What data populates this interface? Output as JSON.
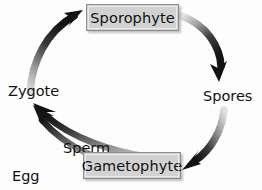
{
  "diagram": {
    "type": "cycle-diagram",
    "background_color": "#fdfdfd",
    "text_color": "#111111",
    "box_fill_color": "#d2d2d2",
    "box_border_color": "#8e8e8e",
    "arrow_dark_color": "#1a1a1a",
    "arrow_light_color": "#cfcfcf",
    "stages": [
      {
        "id": "sporophyte",
        "label": "Sporophyte",
        "boxed": true
      },
      {
        "id": "gametophyte",
        "label": "Gametophyte",
        "boxed": true
      }
    ],
    "nodes": [
      {
        "id": "zygote",
        "label": "Zygote",
        "boxed": false
      },
      {
        "id": "spores",
        "label": "Spores",
        "boxed": false
      }
    ],
    "connectors": [
      {
        "id": "zygote-to-sporophyte",
        "from": "Zygote",
        "to": "Sporophyte",
        "label": "",
        "direction": "up-right",
        "shading": "light-to-dark"
      },
      {
        "id": "sporophyte-to-spores",
        "from": "Sporophyte",
        "to": "Spores",
        "label": "",
        "direction": "down-right",
        "shading": "light-to-dark"
      },
      {
        "id": "spores-to-gametophyte",
        "from": "Spores",
        "to": "Gametophyte",
        "label": "",
        "direction": "down-left",
        "shading": "light-to-dark"
      },
      {
        "id": "gametophyte-to-zygote-sperm",
        "from": "Gametophyte",
        "to": "Zygote",
        "label": "Sperm cells",
        "direction": "up-left",
        "shading": "light-to-dark"
      },
      {
        "id": "gametophyte-to-zygote-egg",
        "from": "Gametophyte",
        "to": "Zygote",
        "label": "Egg cells",
        "direction": "up-left",
        "shading": "light-to-dark"
      }
    ],
    "labels": {
      "sperm_cells_line1": "Sperm",
      "sperm_cells_line2": "cells",
      "egg_cells_line1": "Egg",
      "egg_cells_line2": "cells"
    }
  }
}
